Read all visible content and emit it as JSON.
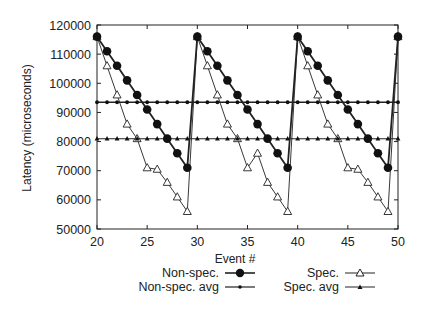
{
  "chart_data": {
    "type": "line",
    "title": "",
    "xlabel": "Event #",
    "ylabel": "Latency (microseconds)",
    "xlim": [
      20,
      50
    ],
    "ylim": [
      50000,
      120000
    ],
    "x_ticks": [
      20,
      25,
      30,
      35,
      40,
      45,
      50
    ],
    "y_ticks": [
      50000,
      60000,
      70000,
      80000,
      90000,
      100000,
      110000,
      120000
    ],
    "grid": false,
    "legend_position": "below",
    "x": [
      20,
      21,
      22,
      23,
      24,
      25,
      26,
      27,
      28,
      29,
      30,
      31,
      32,
      33,
      34,
      35,
      36,
      37,
      38,
      39,
      40,
      41,
      42,
      43,
      44,
      45,
      46,
      47,
      48,
      49,
      50
    ],
    "series": [
      {
        "name": "Non-spec.",
        "marker": "filled-circle",
        "values": [
          116000,
          111000,
          106000,
          101000,
          96000,
          91000,
          86000,
          81000,
          76000,
          71000,
          116000,
          111000,
          106000,
          101000,
          96000,
          91000,
          86000,
          81000,
          76000,
          71000,
          116000,
          111000,
          106000,
          101000,
          96000,
          91000,
          86000,
          81000,
          76000,
          71000,
          116000
        ]
      },
      {
        "name": "Non-spec. avg",
        "marker": "small-dot",
        "values": [
          93500,
          93500,
          93500,
          93500,
          93500,
          93500,
          93500,
          93500,
          93500,
          93500,
          93500,
          93500,
          93500,
          93500,
          93500,
          93500,
          93500,
          93500,
          93500,
          93500,
          93500,
          93500,
          93500,
          93500,
          93500,
          93500,
          93500,
          93500,
          93500,
          93500,
          93500
        ]
      },
      {
        "name": "Spec.",
        "marker": "open-triangle",
        "values": [
          116000,
          106000,
          96000,
          86000,
          81000,
          71000,
          70500,
          66000,
          61000,
          56000,
          116000,
          106000,
          96000,
          86000,
          81000,
          71000,
          76000,
          66000,
          61000,
          56000,
          116000,
          106000,
          96000,
          86000,
          81000,
          71000,
          70500,
          66000,
          61000,
          56000,
          116000
        ]
      },
      {
        "name": "Spec. avg",
        "marker": "small-triangle",
        "values": [
          81000,
          81000,
          81000,
          81000,
          81000,
          81000,
          81000,
          81000,
          81000,
          81000,
          81000,
          81000,
          81000,
          81000,
          81000,
          81000,
          81000,
          81000,
          81000,
          81000,
          81000,
          81000,
          81000,
          81000,
          81000,
          81000,
          81000,
          81000,
          81000,
          81000,
          81000
        ]
      }
    ]
  },
  "legend": {
    "left": [
      {
        "label": "Non-spec."
      },
      {
        "label": "Non-spec. avg"
      }
    ],
    "right": [
      {
        "label": "Spec."
      },
      {
        "label": "Spec. avg"
      }
    ]
  },
  "colors": {
    "line": "#222222",
    "background": "#ffffff"
  }
}
